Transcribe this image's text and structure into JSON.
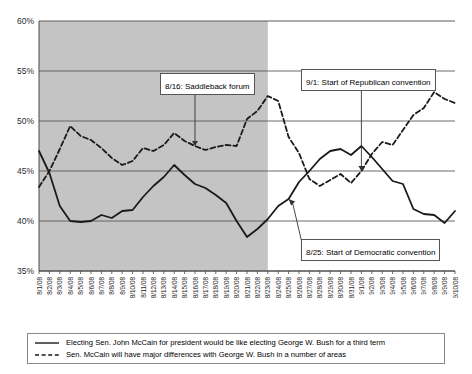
{
  "chart_data": {
    "type": "line",
    "title": "",
    "subtitle": "",
    "xlabel": "",
    "ylabel": "",
    "ylim": [
      35,
      60
    ],
    "ytick_labels": [
      "35%",
      "40%",
      "45%",
      "50%",
      "55%",
      "60%"
    ],
    "ytick_values": [
      35,
      40,
      45,
      50,
      55,
      60
    ],
    "grid": true,
    "legend_position": "bottom",
    "categories": [
      "8/1/08",
      "8/2/08",
      "8/3/08",
      "8/4/08",
      "8/5/08",
      "8/6/08",
      "8/7/08",
      "8/8/08",
      "8/9/08",
      "8/10/08",
      "8/11/08",
      "8/12/08",
      "8/13/08",
      "8/14/08",
      "8/15/08",
      "8/16/08",
      "8/17/08",
      "8/18/08",
      "8/19/08",
      "8/20/08",
      "8/21/08",
      "8/22/08",
      "8/23/08",
      "8/24/08",
      "8/25/08",
      "8/26/08",
      "8/27/08",
      "8/28/08",
      "8/29/08",
      "8/30/08",
      "8/31/08",
      "9/1/08",
      "9/2/08",
      "9/3/08",
      "9/4/08",
      "9/5/08",
      "9/6/08",
      "9/7/08",
      "9/8/08",
      "9/9/08",
      "9/10/08"
    ],
    "series": [
      {
        "name": "Electing Sen. John McCain for president would be like electing George W. Bush for a third term",
        "style": "solid",
        "color": "#1a1a1a",
        "values": [
          47.0,
          44.8,
          41.5,
          40.0,
          39.9,
          40.0,
          40.6,
          40.3,
          41.0,
          41.1,
          42.4,
          43.5,
          44.4,
          45.6,
          44.6,
          43.7,
          43.3,
          42.6,
          41.8,
          40.0,
          38.4,
          39.2,
          40.2,
          41.5,
          42.2,
          43.9,
          45.0,
          46.2,
          47.0,
          47.2,
          46.6,
          47.5,
          46.4,
          45.2,
          44.0,
          43.7,
          41.2,
          40.7,
          40.6,
          39.8,
          41.0
        ]
      },
      {
        "name": "Sen. McCain will have major differences with George W. Bush in a number of areas",
        "style": "dashed",
        "color": "#1a1a1a",
        "values": [
          43.4,
          45.0,
          47.2,
          49.5,
          48.5,
          48.1,
          47.3,
          46.3,
          45.6,
          46.0,
          47.3,
          47.0,
          47.6,
          48.8,
          48.0,
          47.5,
          47.1,
          47.4,
          47.6,
          47.5,
          50.2,
          51.0,
          52.5,
          52.0,
          48.4,
          46.8,
          44.2,
          43.5,
          44.1,
          44.7,
          43.8,
          45.0,
          46.7,
          47.9,
          47.6,
          49.1,
          50.6,
          51.3,
          52.9,
          52.2,
          51.8
        ]
      }
    ],
    "shaded_region": {
      "from": "8/1/08",
      "to": "8/23/08",
      "color": "#c4c4c4"
    },
    "annotations": [
      {
        "id": "saddleback",
        "label": "8/16: Saddleback forum",
        "target_date": "8/16/08",
        "target_value": 47.5
      },
      {
        "id": "republican-convention",
        "label": "9/1: Start of Republican convention",
        "target_date": "9/1/08",
        "target_value": 45.0
      },
      {
        "id": "democratic-convention",
        "label": "8/25: Start of Democratic convention",
        "target_date": "8/25/08",
        "target_value": 42.2
      }
    ]
  },
  "legend": {
    "items": [
      {
        "label": "Electing Sen. John McCain for president would be like electing George W. Bush for a third term",
        "style": "solid"
      },
      {
        "label": "Sen. McCain will have major differences with George W. Bush in a number of areas",
        "style": "dashed"
      }
    ]
  }
}
